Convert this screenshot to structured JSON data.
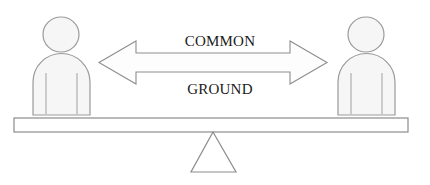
{
  "diagram": {
    "title": "COMMON GROUND",
    "caption": {
      "line1": "COMMON",
      "line2": "GROUND"
    },
    "colors": {
      "background": "#ffffff",
      "figure_outline": "#9a9a9a",
      "figure_fill": "#f6f6f6",
      "arrow_outline": "#8d8d8d",
      "arrow_fill": "#fdfdfd",
      "beam_outline": "#8c8c8c",
      "beam_fill": "#ffffff",
      "fulcrum_outline": "#8c8c8c",
      "fulcrum_fill": "#ffffff",
      "text": "#1a1a1a"
    },
    "shapes": {
      "left_person": {
        "label": "person",
        "head_cx": 61,
        "head_cy": 34.5,
        "head_rx": 18,
        "head_ry": 17.5,
        "body_x": 33,
        "body_y": 55,
        "body_w": 57,
        "body_h": 60,
        "body_radius": 27,
        "arm_left_x": 46,
        "arm_right_x": 77,
        "arm_top_y": 72,
        "arm_bottom_y": 113
      },
      "right_person": {
        "label": "person",
        "head_cx": 366,
        "head_cy": 34.5,
        "head_rx": 18,
        "head_ry": 17.5,
        "body_x": 338,
        "body_y": 55,
        "body_w": 57,
        "body_h": 60,
        "body_radius": 27,
        "arm_left_x": 351,
        "arm_right_x": 382,
        "arm_top_y": 72,
        "arm_bottom_y": 113
      },
      "double_arrow": {
        "label": "double-headed horizontal arrow",
        "left_tip_x": 99,
        "right_tip_x": 327,
        "center_y": 62.5,
        "head_width": 37,
        "head_half_height": 21.5,
        "shaft_half_height": 9.5,
        "points": "99,62.5 136,41 136,53 290,53 290,41 327,62.5 290,84 290,72 136,72 136,84"
      },
      "beam": {
        "label": "balance beam",
        "x": 14,
        "y": 118,
        "width": 394,
        "height": 14
      },
      "fulcrum": {
        "label": "triangle fulcrum",
        "apex_x": 213,
        "apex_y": 132,
        "base_left_x": 191,
        "base_right_x": 236,
        "base_y": 172
      }
    }
  }
}
